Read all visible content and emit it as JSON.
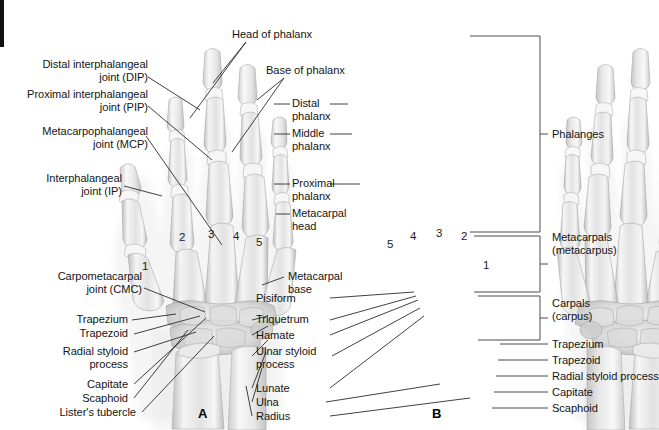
{
  "figure": {
    "panels": [
      {
        "id": "A",
        "letter": "A",
        "view": "posteroanterior left hand radiograph"
      },
      {
        "id": "B",
        "letter": "B",
        "view": "posteroanterior right hand radiograph"
      }
    ],
    "digit_numbers_left": [
      "1",
      "2",
      "3",
      "4",
      "5"
    ],
    "digit_numbers_right": [
      "5",
      "4",
      "3",
      "2",
      "1"
    ]
  },
  "labels_left": [
    {
      "key": "dip",
      "text": "Distal interphalangeal\njoint (DIP)"
    },
    {
      "key": "pip",
      "text": "Proximal interphalangeal\njoint (PIP)"
    },
    {
      "key": "mcp",
      "text": "Metacarpophalangeal\njoint (MCP)"
    },
    {
      "key": "ip",
      "text": "Interphalangeal\njoint (IP)"
    },
    {
      "key": "cmc",
      "text": "Carpometacarpal\njoint (CMC)"
    },
    {
      "key": "trapezium",
      "text": "Trapezium"
    },
    {
      "key": "trapezoid",
      "text": "Trapezoid"
    },
    {
      "key": "radial_styloid",
      "text": "Radial styloid\nprocess"
    },
    {
      "key": "capitate",
      "text": "Capitate"
    },
    {
      "key": "scaphoid",
      "text": "Scaphoid"
    },
    {
      "key": "listers",
      "text": "Lister's tubercle"
    }
  ],
  "labels_top": [
    {
      "key": "head_phalanx",
      "text": "Head of phalanx"
    },
    {
      "key": "base_phalanx",
      "text": "Base of phalanx"
    }
  ],
  "labels_center": [
    {
      "key": "distal_phalanx",
      "text": "Distal\nphalanx"
    },
    {
      "key": "middle_phalanx",
      "text": "Middle\nphalanx"
    },
    {
      "key": "proximal_phalanx",
      "text": "Proximal\nphalanx"
    },
    {
      "key": "metacarpal_head",
      "text": "Metacarpal\nhead"
    },
    {
      "key": "metacarpal_base",
      "text": "Metacarpal\nbase"
    },
    {
      "key": "pisiform",
      "text": "Pisiform"
    },
    {
      "key": "triquetrum",
      "text": "Triquetrum"
    },
    {
      "key": "hamate",
      "text": "Hamate"
    },
    {
      "key": "ulnar_styloid",
      "text": "Ulnar styloid\nprocess"
    },
    {
      "key": "lunate",
      "text": "Lunate"
    },
    {
      "key": "ulna",
      "text": "Ulna"
    },
    {
      "key": "radius",
      "text": "Radius"
    }
  ],
  "labels_right": [
    {
      "key": "phalanges",
      "text": "Phalanges"
    },
    {
      "key": "metacarpals",
      "text": "Metacarpals\n(metacarpus)"
    },
    {
      "key": "carpals",
      "text": "Carpals\n(carpus)"
    },
    {
      "key": "trapezium_r",
      "text": "Trapezium"
    },
    {
      "key": "trapezoid_r",
      "text": "Trapezoid"
    },
    {
      "key": "radial_styloid_r",
      "text": "Radial styloid process"
    },
    {
      "key": "capitate_r",
      "text": "Capitate"
    },
    {
      "key": "scaphoid_r",
      "text": "Scaphoid"
    }
  ],
  "colors": {
    "background": "#ffffff",
    "text": "#141414",
    "leader_line": "#2b2b2b",
    "bracket": "#4a4a4a",
    "bone_light": "#f2f2f2",
    "bone_mid": "#d8d8d8",
    "bone_dark": "#a8a8a8",
    "soft_tissue": "#ededed",
    "edge_bar": "#111111"
  }
}
